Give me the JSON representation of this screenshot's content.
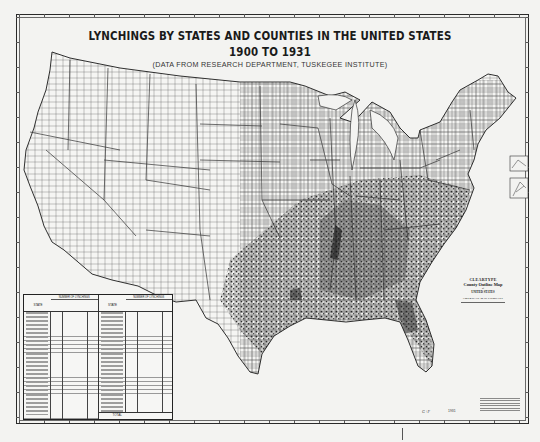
{
  "map": {
    "title_line1": "LYNCHINGS BY STATES AND COUNTIES IN THE UNITED STATES",
    "title_line2": "1900 TO 1931",
    "subtitle": "(DATA FROM RESEARCH DEPARTMENT, TUSKEGEE INSTITUTE)",
    "style": "grayscale county outline map with lynching dots, densest in the South",
    "colors": {
      "paper": "#f3f3f1",
      "ink": "#1a1a1a",
      "dots": "#222222"
    }
  },
  "table": {
    "group_header": "NUMBER OF LYNCHINGS",
    "state_header": "STATE",
    "total_label": "TOTAL"
  },
  "cartouche": {
    "line1": "CLEARTYPE",
    "line2": "County Outline Map",
    "line3": "of",
    "line4": "UNITED STATES",
    "line5": "AMERICAN MAP COMPANY"
  },
  "margins": {
    "call_number": "G+F",
    "year": "1931"
  }
}
